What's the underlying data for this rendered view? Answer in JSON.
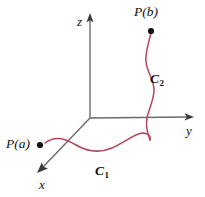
{
  "figure": {
    "kind": "3d-axes-line-integral-diagram",
    "background_color": "#ffffff",
    "axis_color": "#6b6b6b",
    "curve_color": "#b5445a",
    "point_color": "#111111",
    "label_color": "#111111"
  },
  "axes": {
    "origin": {
      "x": 90,
      "y": 118
    },
    "z": {
      "label": "z",
      "tip": {
        "x": 90,
        "y": 14
      }
    },
    "y": {
      "label": "y",
      "tip": {
        "x": 193,
        "y": 117
      }
    },
    "x": {
      "label": "x",
      "tip": {
        "x": 38,
        "y": 172
      }
    }
  },
  "points": [
    {
      "name": "point-a",
      "label": "P(a)",
      "dot": {
        "x": 40,
        "y": 145
      }
    },
    {
      "name": "point-b",
      "label": "P(b)",
      "dot": {
        "x": 151,
        "y": 31
      }
    }
  ],
  "curves": [
    {
      "name": "curve-c1",
      "label": "C",
      "subscript": "1",
      "path": "M 45 143 C 56 135 66 139 76 145 C 88 152 100 153 112 148 C 124 143 134 134 142 133 C 148 133 151 136 150 140"
    },
    {
      "name": "curve-c2",
      "label": "C",
      "subscript": "2",
      "path": "M 150 140 C 148 134 145 128 147 118 C 149 108 154 100 154 90 C 154 80 147 72 146 62 C 145 52 149 42 151 33"
    }
  ]
}
